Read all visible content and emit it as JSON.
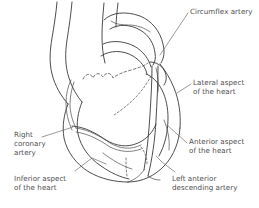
{
  "figure": {
    "type": "anatomical-line-diagram",
    "background_color": "#ffffff",
    "line_color": "#3a3a3a",
    "text_color": "#4d4d4d",
    "width": 259,
    "height": 208
  },
  "labels": {
    "circumflex_artery": {
      "lines": [
        "Circumflex artery"
      ],
      "line1": "Circumflex artery",
      "x": 190,
      "y": 8
    },
    "lateral_aspect": {
      "lines": [
        "Lateral aspect",
        "of the heart"
      ],
      "line1": "Lateral aspect",
      "line2": "of the heart",
      "x": 193,
      "y": 79
    },
    "anterior_aspect": {
      "lines": [
        "Anterior aspect",
        "of the heart"
      ],
      "line1": "Anterior aspect",
      "line2": "of the heart",
      "x": 189,
      "y": 138
    },
    "left_anterior_descending_artery": {
      "lines": [
        "Left anterior",
        "descending artery"
      ],
      "line1": "Left anterior",
      "line2": "descending artery",
      "x": 172,
      "y": 175
    },
    "right_coronary_artery": {
      "lines": [
        "Right",
        "coronary",
        "artery"
      ],
      "line1": "Right",
      "line2": "coronary",
      "line3": "artery",
      "x": 14,
      "y": 131
    },
    "inferior_aspect": {
      "lines": [
        "Inferior aspect",
        "of the heart"
      ],
      "line1": "Inferior aspect",
      "line2": "of the heart",
      "x": 14,
      "y": 175
    }
  }
}
